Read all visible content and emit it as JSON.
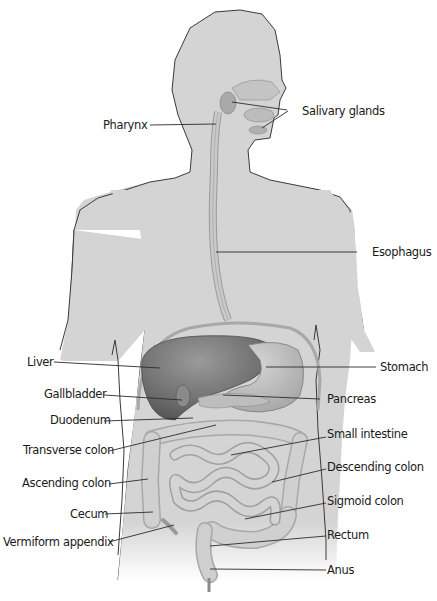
{
  "figure": {
    "colors": {
      "body_fill": "#d4d4d4",
      "body_outline": "#3a3a3a",
      "liver": "#7a7a7a",
      "liver_dark": "#5e5e5e",
      "stomach": "#bdbdbd",
      "intestine": "#c9c9c9",
      "leader_line": "#2b2b2b",
      "label_text": "#1a1a1a"
    }
  },
  "labels": {
    "left": [
      {
        "id": "pharynx",
        "text": "Pharynx"
      },
      {
        "id": "liver",
        "text": "Liver"
      },
      {
        "id": "gallbladder",
        "text": "Gallbladder"
      },
      {
        "id": "duodenum",
        "text": "Duodenum"
      },
      {
        "id": "transverse_colon",
        "text": "Transverse colon"
      },
      {
        "id": "ascending_colon",
        "text": "Ascending colon"
      },
      {
        "id": "cecum",
        "text": "Cecum"
      },
      {
        "id": "vermiform_appendix",
        "text": "Vermiform appendix"
      }
    ],
    "right": [
      {
        "id": "salivary_glands",
        "text": "Salivary glands"
      },
      {
        "id": "esophagus",
        "text": "Esophagus"
      },
      {
        "id": "stomach",
        "text": "Stomach"
      },
      {
        "id": "pancreas",
        "text": "Pancreas"
      },
      {
        "id": "small_intestine",
        "text": "Small intestine"
      },
      {
        "id": "descending_colon",
        "text": "Descending colon"
      },
      {
        "id": "sigmoid_colon",
        "text": "Sigmoid colon"
      },
      {
        "id": "rectum",
        "text": "Rectum"
      },
      {
        "id": "anus",
        "text": "Anus"
      }
    ]
  }
}
